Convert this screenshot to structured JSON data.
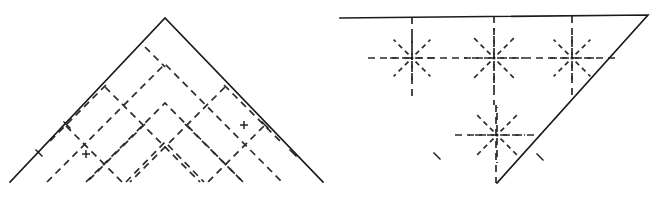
{
  "document": {
    "title": "Origami crease pattern figures",
    "background_color": "#ffffff",
    "width": 665,
    "height": 197,
    "figure_count": 2
  },
  "style": {
    "solid_stroke_color": "#1a1a1a",
    "dashed_stroke_color": "#2b2b2b",
    "solid_stroke_width": 1.6,
    "dashed_stroke_width": 1.7,
    "dash_pattern": "7,5",
    "dash_pattern_short": "5,4"
  },
  "figures": [
    {
      "id": "figure-left",
      "name": "left-crease-pattern",
      "caption": "",
      "shape": "isoceles-triangle-apex-up",
      "outline": {
        "label": "triangle-outline",
        "points": "10,182 165,18 323,182",
        "vertices": [
          {
            "name": "bottom-left",
            "x": 10,
            "y": 182
          },
          {
            "name": "apex-top",
            "x": 165,
            "y": 18
          },
          {
            "name": "bottom-right",
            "x": 323,
            "y": 182
          }
        ]
      },
      "creases_description": "45-degree diagonal grid of dashed mountain/valley folds forming nested chevrons",
      "chevrons": [
        {
          "label": "chevron-outer",
          "points": "47,182 165,64 282,182"
        },
        {
          "label": "chevron-middle",
          "points": "86,182 165,103 243,182"
        },
        {
          "label": "chevron-inner",
          "points": "126,182 165,142 204,182"
        }
      ],
      "diagonals_right_leaning": [
        {
          "label": "diag-r-1",
          "x1": 66,
          "y1": 126,
          "x2": 122,
          "y2": 182
        },
        {
          "label": "diag-r-2",
          "x1": 105,
          "y1": 87,
          "x2": 200,
          "y2": 182
        },
        {
          "label": "diag-r-3",
          "x1": 145,
          "y1": 47,
          "x2": 165,
          "y2": 67
        },
        {
          "label": "diag-r-4",
          "x1": 185,
          "y1": 124,
          "x2": 243,
          "y2": 182
        },
        {
          "label": "diag-r-5",
          "x1": 224,
          "y1": 85,
          "x2": 282,
          "y2": 143
        }
      ],
      "diagonals_left_leaning": [
        {
          "label": "diag-l-1",
          "x1": 264,
          "y1": 126,
          "x2": 208,
          "y2": 182
        },
        {
          "label": "diag-l-2",
          "x1": 225,
          "y1": 87,
          "x2": 130,
          "y2": 182
        },
        {
          "label": "diag-l-3",
          "x1": 145,
          "y1": 124,
          "x2": 87,
          "y2": 182
        },
        {
          "label": "diag-l-4",
          "x1": 106,
          "y1": 85,
          "x2": 48,
          "y2": 143
        }
      ],
      "tick_marks": [
        {
          "label": "tick-left-upper",
          "x": 67,
          "y": 125
        },
        {
          "label": "tick-right-upper",
          "x": 265,
          "y": 125
        },
        {
          "label": "tick-left-edge",
          "x": 39,
          "y": 153
        },
        {
          "label": "tick-right-edge",
          "x": 293,
          "y": 153
        }
      ],
      "cross_marks": [
        {
          "label": "cross-left",
          "x": 86,
          "y": 154
        },
        {
          "label": "cross-right",
          "x": 244,
          "y": 125
        }
      ]
    },
    {
      "id": "figure-right",
      "name": "right-crease-pattern",
      "caption": "",
      "shape": "triangle-apex-down",
      "outline": {
        "label": "triangle-outline",
        "points": "340,18 648,15 497,183",
        "vertices": [
          {
            "name": "top-left",
            "x": 340,
            "y": 18
          },
          {
            "name": "top-right",
            "x": 648,
            "y": 15
          },
          {
            "name": "bottom-apex",
            "x": 497,
            "y": 183
          }
        ]
      },
      "creases_description": "Four eight-ray dashed star vertices joined by a horizontal dashed spine and vertical dashed creases",
      "stars": [
        {
          "label": "star-left",
          "cx": 412,
          "cy": 58,
          "rays": 8,
          "radius": 26
        },
        {
          "label": "star-center",
          "cx": 494,
          "cy": 58,
          "rays": 8,
          "radius": 30
        },
        {
          "label": "star-right",
          "cx": 572,
          "cy": 58,
          "rays": 8,
          "radius": 26
        },
        {
          "label": "star-bottom",
          "cx": 497,
          "cy": 135,
          "rays": 8,
          "radius": 28
        }
      ],
      "spine": {
        "label": "horizontal-spine",
        "x1": 368,
        "y1": 58,
        "x2": 620,
        "y2": 58
      },
      "bottom_spine": {
        "label": "bottom-horizontal-spine",
        "x1": 455,
        "y1": 135,
        "x2": 540,
        "y2": 135
      },
      "verticals": [
        {
          "label": "vertical-left",
          "x": 412,
          "y1": 17,
          "y2": 98
        },
        {
          "label": "vertical-center-upper",
          "x": 494,
          "y1": 16,
          "y2": 105
        },
        {
          "label": "vertical-center-lower",
          "x": 496,
          "y1": 105,
          "y2": 183
        },
        {
          "label": "vertical-right",
          "x": 572,
          "y1": 16,
          "y2": 98
        }
      ],
      "tick_marks": [
        {
          "label": "tick-bottom-left-edge",
          "x": 437,
          "y": 156
        },
        {
          "label": "tick-bottom-right-edge",
          "x": 540,
          "y": 157
        }
      ]
    }
  ]
}
